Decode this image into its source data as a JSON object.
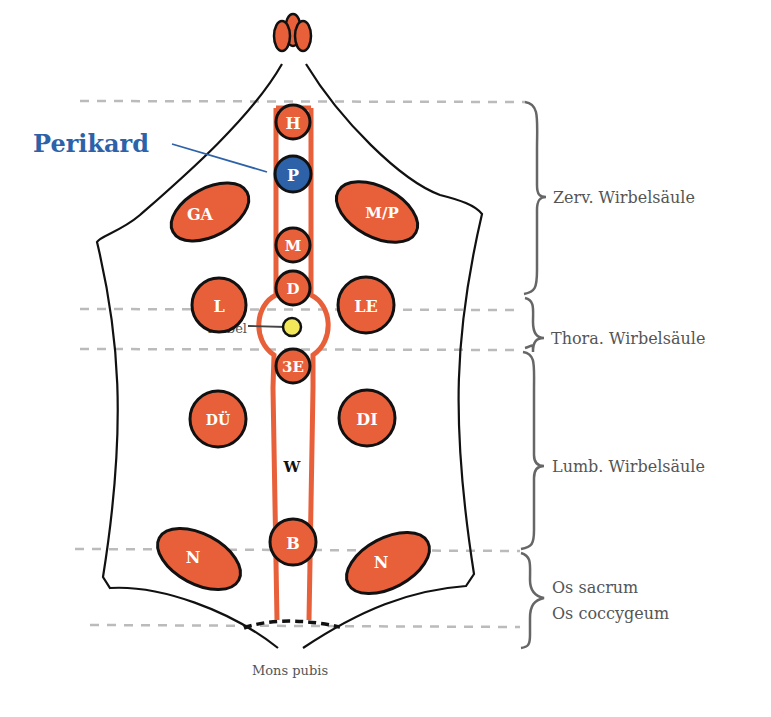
{
  "colors": {
    "organ_fill": "#e8603a",
    "organ_stroke": "#111111",
    "highlight_fill": "#2e62a8",
    "highlight_text": "#2e62a8",
    "navel_fill": "#f2e85a",
    "body_outline": "#111111",
    "dashed_line": "#bbbbbb",
    "brace": "#666666",
    "label_text": "#555555"
  },
  "title_callout": {
    "label": "Perikard"
  },
  "central_column": {
    "organs": [
      {
        "id": "G",
        "label": "G"
      },
      {
        "id": "H",
        "label": "H"
      },
      {
        "id": "P",
        "label": "P",
        "highlighted": true
      },
      {
        "id": "M",
        "label": "M"
      },
      {
        "id": "D",
        "label": "D"
      },
      {
        "id": "3E",
        "label": "3E"
      },
      {
        "id": "W",
        "label": "W"
      },
      {
        "id": "B",
        "label": "B"
      }
    ],
    "navel": {
      "label": "Nabel"
    }
  },
  "lateral_organs": {
    "left": [
      {
        "id": "GA",
        "label": "GA"
      },
      {
        "id": "L",
        "label": "L"
      },
      {
        "id": "DU",
        "label": "DÜ"
      },
      {
        "id": "N_left",
        "label": "N"
      }
    ],
    "right": [
      {
        "id": "MP",
        "label": "M/P"
      },
      {
        "id": "LE",
        "label": "LE"
      },
      {
        "id": "DI",
        "label": "DI"
      },
      {
        "id": "N_right",
        "label": "N"
      }
    ]
  },
  "spine_regions": [
    {
      "label": "Zerv. Wirbelsäule"
    },
    {
      "label": "Thora. Wirbelsäule"
    },
    {
      "label": "Lumb. Wirbelsäule"
    },
    {
      "label_line1": "Os sacrum",
      "label_line2": "Os coccygeum"
    }
  ],
  "bottom_label": "Mons pubis"
}
